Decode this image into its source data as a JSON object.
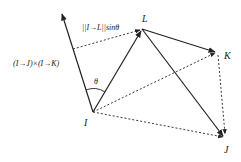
{
  "diagram": {
    "type": "vector-geometry",
    "colors": {
      "stroke": "#222222",
      "background": "#ffffff"
    },
    "vertices": [
      {
        "id": "I",
        "label": "I",
        "x": 93,
        "y": 112
      },
      {
        "id": "L",
        "label": "L",
        "x": 142,
        "y": 29
      },
      {
        "id": "K",
        "label": "K",
        "x": 216,
        "y": 52
      },
      {
        "id": "J",
        "label": "J",
        "x": 224,
        "y": 137
      }
    ],
    "solid_arrows": [
      {
        "from": "I",
        "to": "L"
      },
      {
        "from": "L",
        "to": "K"
      },
      {
        "from": "L",
        "to": "J"
      },
      {
        "from": "I",
        "to": "normal"
      }
    ],
    "dashed_arrows": [
      {
        "from": "I",
        "to": "K"
      },
      {
        "from": "I",
        "to": "J"
      },
      {
        "from": "K",
        "to": "J"
      },
      {
        "from": "normal-foot",
        "to": "L"
      }
    ],
    "labels": {
      "cross_product": "(I→J)×(I→K)",
      "projection": "||I→L||sinθ",
      "angle": "θ",
      "I": "I",
      "L": "L",
      "K": "K",
      "J": "J"
    }
  }
}
